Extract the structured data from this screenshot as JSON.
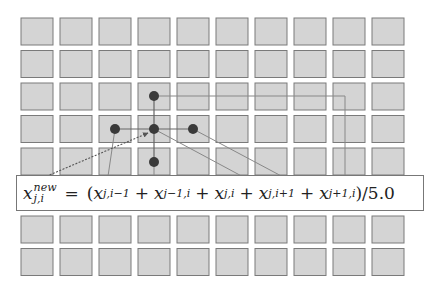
{
  "diagram": {
    "type": "stencil-grid",
    "grid": {
      "columns": 10,
      "rows_visible": 7,
      "cell_fill": "#d4d4d4",
      "cell_stroke": "#7a7a7a",
      "origin_x": 21,
      "origin_y": 18,
      "cell_width": 32,
      "cell_height": 27,
      "pitch_x": 39,
      "pitch_y": 32.5,
      "row_y": [
        18,
        50.5,
        83,
        115.5,
        148,
        216,
        248.5
      ]
    },
    "stencil": {
      "node_color": "#3a3a3a",
      "center": {
        "col": 3,
        "row": 3,
        "label": "x_{j,i}"
      },
      "neighbors": [
        {
          "name": "left",
          "col": 2,
          "row": 3,
          "label": "x_{j,i-1}"
        },
        {
          "name": "up",
          "col": 3,
          "row": 2,
          "label": "x_{j-1,i}"
        },
        {
          "name": "right",
          "col": 4,
          "row": 3,
          "label": "x_{j,i+1}"
        },
        {
          "name": "down",
          "col": 3,
          "row": 4,
          "label": "x_{j+1,i}"
        }
      ]
    },
    "formula": {
      "lhs": "x",
      "lhs_sup": "new",
      "lhs_sub": "j,i",
      "equals": "=",
      "open": "(",
      "terms": [
        {
          "base": "x",
          "sub": "j,i−1"
        },
        {
          "base": "x",
          "sub": "j−1,i"
        },
        {
          "base": "x",
          "sub": "j,i"
        },
        {
          "base": "x",
          "sub": "j,i+1"
        },
        {
          "base": "x",
          "sub": "j+1,i"
        }
      ],
      "plus": "+",
      "close_div": ")/5.0"
    }
  }
}
